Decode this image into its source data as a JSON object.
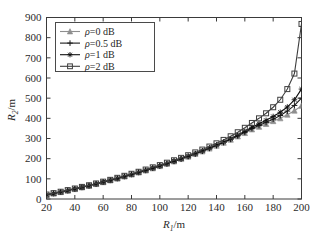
{
  "figure": {
    "background": "#ffffff",
    "frame_color": "#3a3a3a"
  },
  "chart_data": {
    "type": "line",
    "title": "",
    "xlabel": "R₁/m",
    "ylabel": "R₂/m",
    "xlabel_base": "R",
    "xlabel_sub": "1",
    "xlabel_unit": "/m",
    "ylabel_base": "R",
    "ylabel_sub": "2",
    "ylabel_unit": "/m",
    "xlim": [
      20,
      200
    ],
    "ylim": [
      0,
      900
    ],
    "xticks": [
      20,
      40,
      60,
      80,
      100,
      120,
      140,
      160,
      180,
      200
    ],
    "yticks": [
      0,
      100,
      200,
      300,
      400,
      500,
      600,
      700,
      800,
      900
    ],
    "grid": false,
    "legend_position": "upper-left",
    "x": [
      20,
      25,
      30,
      35,
      40,
      45,
      50,
      55,
      60,
      65,
      70,
      75,
      80,
      85,
      90,
      95,
      100,
      105,
      110,
      115,
      120,
      125,
      130,
      135,
      140,
      145,
      150,
      155,
      160,
      165,
      170,
      175,
      180,
      185,
      190,
      195,
      200
    ],
    "series": [
      {
        "name": "ρ=0 dB",
        "label_symbol": "ρ",
        "label_value": "=0 dB",
        "color": "#8f8f8f",
        "marker": "triangle",
        "values": [
          20,
          27,
          34,
          41,
          49,
          57,
          65,
          74,
          83,
          92,
          101,
          111,
          121,
          131,
          141,
          152,
          163,
          174,
          186,
          198,
          210,
          223,
          236,
          250,
          264,
          279,
          294,
          310,
          327,
          345,
          358,
          372,
          386,
          400,
          418,
          438,
          462
        ]
      },
      {
        "name": "ρ=0.5 dB",
        "label_symbol": "ρ",
        "label_value": "=0.5 dB",
        "color": "#1a1a1a",
        "marker": "plus",
        "values": [
          21,
          28,
          35,
          42,
          50,
          58,
          66,
          75,
          84,
          93,
          102,
          112,
          122,
          132,
          142,
          153,
          164,
          175,
          187,
          199,
          211,
          224,
          237,
          251,
          265,
          280,
          296,
          313,
          331,
          350,
          365,
          380,
          396,
          414,
          436,
          464,
          500
        ]
      },
      {
        "name": "ρ=1 dB",
        "label_symbol": "ρ",
        "label_value": "=1 dB",
        "color": "#101010",
        "marker": "star",
        "values": [
          21,
          28,
          35,
          43,
          51,
          59,
          67,
          76,
          85,
          94,
          103,
          113,
          123,
          133,
          143,
          154,
          165,
          176,
          188,
          200,
          212,
          225,
          239,
          253,
          268,
          283,
          299,
          317,
          336,
          356,
          373,
          390,
          409,
          430,
          456,
          492,
          545
        ]
      },
      {
        "name": "ρ=2 dB",
        "label_symbol": "ρ",
        "label_value": "=2 dB",
        "color": "#3f3f3f",
        "marker": "square",
        "values": [
          22,
          29,
          36,
          44,
          52,
          60,
          68,
          77,
          86,
          95,
          105,
          115,
          125,
          135,
          146,
          157,
          168,
          180,
          192,
          204,
          217,
          231,
          245,
          260,
          276,
          293,
          311,
          331,
          353,
          377,
          400,
          425,
          455,
          492,
          545,
          622,
          868
        ]
      }
    ]
  },
  "legend": {
    "entries": [
      {
        "text": "ρ=0 dB"
      },
      {
        "text": "ρ=0.5 dB"
      },
      {
        "text": "ρ=1 dB"
      },
      {
        "text": "ρ=2 dB"
      }
    ]
  }
}
